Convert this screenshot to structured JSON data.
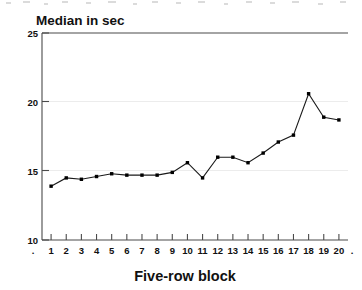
{
  "chart_data": {
    "type": "line",
    "title": "Median in sec",
    "xlabel": "Five-row block",
    "ylabel": "Median in sec",
    "x": [
      1,
      2,
      3,
      4,
      5,
      6,
      7,
      8,
      9,
      10,
      11,
      12,
      13,
      14,
      15,
      16,
      17,
      18,
      19,
      20
    ],
    "categories": [
      "1",
      "2",
      "3",
      "4",
      "5",
      "6",
      "7",
      "8",
      "9",
      "10",
      "11",
      "12",
      "13",
      "14",
      "15",
      "16",
      "17",
      "18",
      "19",
      "20"
    ],
    "values": [
      13.9,
      14.5,
      14.4,
      14.6,
      14.8,
      14.7,
      14.7,
      14.7,
      14.9,
      15.6,
      14.5,
      16.0,
      16.0,
      15.6,
      16.3,
      17.1,
      17.6,
      20.6,
      18.9,
      18.7
    ],
    "series": [
      {
        "name": "Median in sec",
        "values": [
          13.9,
          14.5,
          14.4,
          14.6,
          14.8,
          14.7,
          14.7,
          14.7,
          14.9,
          15.6,
          14.5,
          16.0,
          16.0,
          15.6,
          16.3,
          17.1,
          17.6,
          20.6,
          18.9,
          18.7
        ]
      }
    ],
    "ylim": [
      10,
      25
    ],
    "xlim": [
      0.4,
      20.6
    ],
    "yticks": [
      10,
      15,
      20,
      25
    ],
    "ytick_labels": [
      "10",
      "15",
      "20",
      "25"
    ],
    "xticks": [
      1,
      2,
      3,
      4,
      5,
      6,
      7,
      8,
      9,
      10,
      11,
      12,
      13,
      14,
      15,
      16,
      17,
      18,
      19,
      20
    ],
    "xtick_labels": [
      "1",
      "2",
      "3",
      "4",
      "5",
      "6",
      "7",
      "8",
      "9",
      "10",
      "11",
      "12",
      "13",
      "14",
      "15",
      "16",
      "17",
      "18",
      "19",
      "20"
    ],
    "grid": "horizontal-light",
    "legend": "none",
    "marker": "filled-square",
    "line_color": "#1a1a1a",
    "marker_color": "#000000",
    "grid_color": "#e9e9e9",
    "axis_color": "#555555",
    "text_color": "#111111",
    "background": "#ffffff",
    "end_dot_left": ".",
    "end_dot_right": "."
  }
}
